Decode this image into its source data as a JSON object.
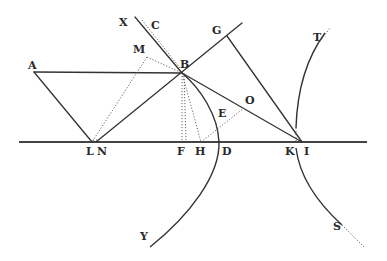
{
  "figure": {
    "background": "#ffffff",
    "ink_color": "#333333"
  },
  "labels": {
    "A": "A",
    "B": "B",
    "C": "C",
    "D": "D",
    "E": "E",
    "F": "F",
    "G": "G",
    "H": "H",
    "I": "I",
    "K": "K",
    "L": "L",
    "M": "M",
    "N": "N",
    "O": "O",
    "S": "S",
    "T": "T",
    "X": "X",
    "Y": "Y"
  },
  "points": {
    "A": [
      36,
      72
    ],
    "B": [
      182,
      73
    ],
    "C": [
      158,
      34
    ],
    "D": [
      219,
      142
    ],
    "E": [
      226,
      120
    ],
    "F": [
      182,
      142
    ],
    "G": [
      227,
      36
    ],
    "H": [
      201,
      142
    ],
    "I": [
      302,
      142
    ],
    "K": [
      295,
      142
    ],
    "L": [
      92,
      143
    ],
    "M": [
      147,
      57
    ],
    "N": [
      96,
      142
    ],
    "O": [
      244,
      107
    ],
    "S": [
      342,
      222
    ],
    "T": [
      325,
      33
    ],
    "X": [
      135,
      17
    ],
    "Y": [
      150,
      247
    ]
  }
}
